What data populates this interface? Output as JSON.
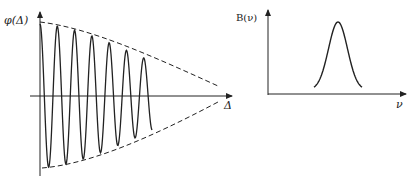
{
  "figure": {
    "left_panel": {
      "y_label": "φ(Δ)",
      "x_label": "Δ",
      "description": "Interferogram: damped cosine oscillation within a decaying dashed envelope",
      "periods": 11,
      "amplitude_start": 72,
      "amplitude_end": 8
    },
    "right_panel": {
      "y_label": "B(ν)",
      "x_label": "ν",
      "description": "Spectrum: single Gaussian-shaped line"
    },
    "colors": {
      "ink": "#222222",
      "background": "#ffffff"
    }
  }
}
